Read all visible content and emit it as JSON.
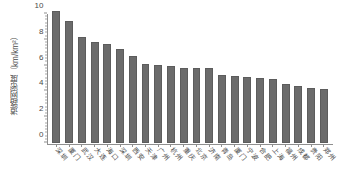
{
  "chart_data": {
    "type": "bar",
    "title": "",
    "xlabel": "",
    "ylabel": "道路网密度（km/km²）",
    "ylim": [
      0,
      10
    ],
    "yticks": [
      0,
      2,
      4,
      6,
      8,
      10
    ],
    "ytick_labels": [
      "0",
      "2",
      "4",
      "6",
      "8",
      "10"
    ],
    "grid": false,
    "legend": "none",
    "bar_color": "#6b6b6b",
    "axis_color": "#8f8f8f",
    "text_color": "#4a4a4a",
    "categories": [
      "深圳",
      "厦门",
      "武汉",
      "大连",
      "海口",
      "深圳",
      "西安",
      "天津",
      "广州",
      "杭州",
      "重庆",
      "北京",
      "济南",
      "青岛",
      "厦门",
      "宁波",
      "合肥",
      "上海",
      "福州",
      "成都",
      "贵阳",
      "郑州"
    ],
    "values": [
      10.2,
      9.45,
      8.25,
      7.8,
      7.65,
      7.25,
      6.75,
      6.15,
      6.05,
      5.95,
      5.85,
      5.85,
      5.8,
      5.3,
      5.2,
      5.1,
      5.05,
      4.95,
      4.55,
      4.45,
      4.25,
      4.2
    ]
  }
}
